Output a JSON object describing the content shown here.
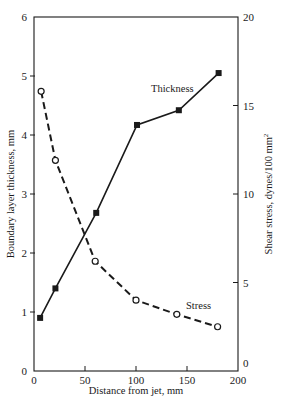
{
  "chart_data": {
    "type": "line",
    "title": "",
    "xlabel": "Distance from jet, mm",
    "ylabel": "Boundary layer thickness, mm",
    "y2label": "Shear stress, dynes/100 mm²",
    "xlim": [
      0,
      200
    ],
    "ylim": [
      0,
      6
    ],
    "y2lim": [
      0,
      20
    ],
    "xticks": [
      0,
      50,
      100,
      150,
      200
    ],
    "yticks": [
      0,
      1,
      2,
      3,
      4,
      5,
      6
    ],
    "y2ticks": [
      0,
      5,
      10,
      15,
      20
    ],
    "grid": false,
    "legend": "inline labels",
    "series": [
      {
        "name": "Thickness",
        "axis": "left",
        "style": "solid",
        "marker": "filled-square",
        "x": [
          6,
          21,
          61,
          101,
          142,
          181
        ],
        "values": [
          0.9,
          1.4,
          2.68,
          4.17,
          4.42,
          5.05
        ]
      },
      {
        "name": "Stress",
        "axis": "right",
        "style": "dashed",
        "marker": "open-circle",
        "x": [
          7,
          21,
          60,
          100,
          140,
          180
        ],
        "values": [
          15.8,
          11.9,
          6.2,
          4.0,
          3.2,
          2.5
        ]
      }
    ]
  },
  "labels": {
    "xlabel": "Distance from jet, mm",
    "ylabel": "Boundary layer thickness, mm",
    "y2label_main": "Shear stress, dynes/100 mm",
    "y2label_sup": "2",
    "thickness": "Thickness",
    "stress": "Stress"
  },
  "colors": {
    "line": "#1a1a1a",
    "background": "#ffffff"
  }
}
